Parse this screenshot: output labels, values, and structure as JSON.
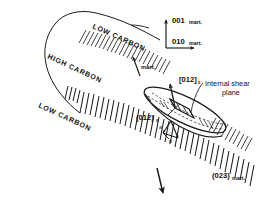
{
  "figure": {
    "background_color": "#ffffff",
    "ink_color": "#1a1a1a",
    "width": 272,
    "height": 222
  },
  "bands": {
    "low_carbon_upper": "LOW CARBON",
    "high_carbon": "HIGH CARBON",
    "low_carbon_lower": "LOW CARBON"
  },
  "axes": {
    "vertical": {
      "index": "001",
      "subscript": "mart."
    },
    "horizontal": {
      "index": "010",
      "subscript": "mart."
    }
  },
  "labels": {
    "habit_arrow": {
      "subscript": "mart."
    },
    "shear_direction": {
      "index": "[012]",
      "subscript": "ε"
    },
    "shear_plane_trace": {
      "index": "(012)",
      "subscript": "ε"
    },
    "internal_shear_plane": {
      "line1": "Internal shear",
      "line2": "plane"
    },
    "bottom_plane": {
      "index": "(023)",
      "subscript": "mart."
    },
    "vector_a": "a",
    "vector_b": "b"
  }
}
